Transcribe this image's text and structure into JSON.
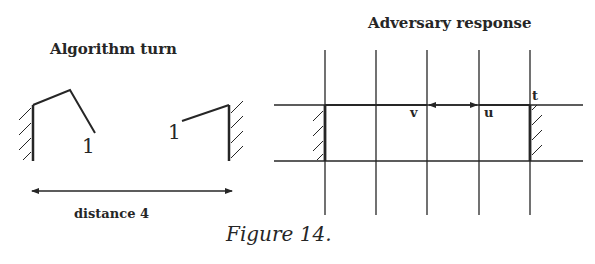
{
  "left_panel": {
    "title": "Algorithm turn",
    "left_robot_label": "1",
    "right_robot_label": "1",
    "distance_label": "distance 4"
  },
  "right_panel": {
    "title": "Adversary response",
    "node_labels": {
      "v": "v",
      "u": "u",
      "t": "t"
    }
  },
  "caption": "Figure 14."
}
